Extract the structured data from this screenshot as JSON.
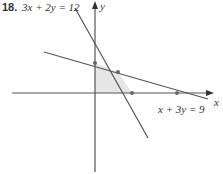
{
  "problem": {
    "number": "18.",
    "equation_top": "3x + 2y = 12"
  },
  "axes": {
    "x_label": "x",
    "y_label": "y"
  },
  "lines": [
    {
      "equation": "3x + 2y = 12"
    },
    {
      "equation": "x + 3y = 9",
      "label": "x + 3y = 9"
    }
  ],
  "colors": {
    "axis": "#555555",
    "line": "#555555",
    "shade": "#e6e6e6"
  }
}
